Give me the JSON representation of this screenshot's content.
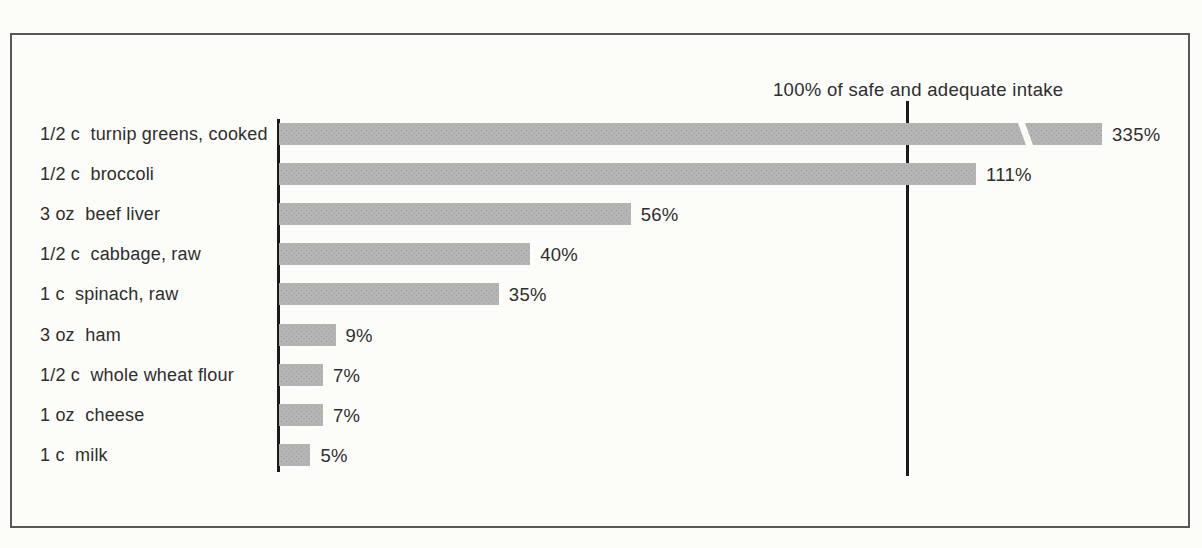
{
  "colors": {
    "bar_fill": "#b5b5b5",
    "bar_dot": "#979797",
    "line_color": "#1a1a1a",
    "frame_border": "#585858",
    "text_color": "#2e2e2e",
    "page_bg": "#fcfcf9"
  },
  "chart_data": {
    "type": "bar",
    "orientation": "horizontal",
    "title": "",
    "xlabel": "",
    "ylabel": "",
    "grid": false,
    "unit": "%",
    "categories": [
      "1/2 c  turnip greens, cooked",
      "1/2 c  broccoli",
      "3 oz  beef liver",
      "1/2 c  cabbage, raw",
      "1 c  spinach, raw",
      "3 oz  ham",
      "1/2 c  whole wheat flour",
      "1 oz  cheese",
      "1 c  milk"
    ],
    "values": [
      335,
      111,
      56,
      40,
      35,
      9,
      7,
      7,
      5
    ],
    "value_labels": [
      "335%",
      "111%",
      "56%",
      "40%",
      "35%",
      "9%",
      "7%",
      "7%",
      "5%"
    ],
    "reference_line_label": "100% of safe and adequate intake",
    "reference_value": 100,
    "truncated_bar_index": 0,
    "xlim_display": [
      0,
      131
    ]
  }
}
